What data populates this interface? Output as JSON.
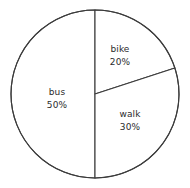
{
  "chart_data": {
    "type": "pie",
    "title": "",
    "categories": [
      "bus",
      "walk",
      "bike"
    ],
    "values": [
      50,
      30,
      20
    ],
    "units": "%",
    "legend": "none",
    "slices": [
      {
        "name": "bike",
        "value": 20,
        "value_label": "20%",
        "start_angle_deg": 0,
        "end_angle_deg": 72,
        "fill": "#ffffff",
        "stroke": "#3c3c3c"
      },
      {
        "name": "walk",
        "value": 30,
        "value_label": "30%",
        "start_angle_deg": 72,
        "end_angle_deg": 180,
        "fill": "#ffffff",
        "stroke": "#3c3c3c"
      },
      {
        "name": "bus",
        "value": 50,
        "value_label": "50%",
        "start_angle_deg": 180,
        "end_angle_deg": 360,
        "fill": "#ffffff",
        "stroke": "#3c3c3c"
      }
    ]
  },
  "labels": {
    "bike": {
      "name": "bike",
      "value": "20%"
    },
    "bus": {
      "name": "bus",
      "value": "50%"
    },
    "walk": {
      "name": "walk",
      "value": "30%"
    }
  },
  "style": {
    "background": "#ffffff",
    "outline_color": "#3c3c3c",
    "text_color": "#2b2b2b"
  }
}
